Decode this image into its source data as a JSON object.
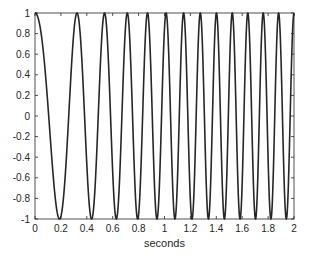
{
  "chart_data": {
    "type": "line",
    "title": "",
    "xlabel": "seconds",
    "ylabel": "",
    "xlim": [
      0,
      2
    ],
    "ylim": [
      -1,
      1
    ],
    "grid": false,
    "legend": null,
    "x_ticks": [
      "0",
      "0.2",
      "0.4",
      "0.6",
      "0.8",
      "1",
      "1.2",
      "1.4",
      "1.6",
      "1.8",
      "2"
    ],
    "y_ticks": [
      "1",
      "0.8",
      "0.6",
      "0.4",
      "0.2",
      "0",
      "-0.2",
      "-0.4",
      "-0.6",
      "-0.8",
      "-1"
    ],
    "series": [
      {
        "name": "chirp",
        "color": "#262626",
        "description": "cosine chirp with increasing frequency; y = cos(2*pi*(1.99 t + 3.59 t^2 - 0.668 t^3))",
        "phase_coeffs": [
          1.99,
          3.59,
          -0.668
        ],
        "peaks_t": [
          0,
          0.324,
          0.541,
          0.71,
          0.865,
          1.012,
          1.151,
          1.29,
          1.405,
          1.529,
          1.653,
          1.776,
          1.884,
          2.0
        ],
        "troughs_t": [
          0.185,
          0.425,
          0.618,
          0.788,
          0.934,
          1.081,
          1.212,
          1.344,
          1.459,
          1.583,
          1.707,
          1.815,
          1.923
        ]
      }
    ]
  },
  "axes": {
    "x_label": "seconds"
  }
}
